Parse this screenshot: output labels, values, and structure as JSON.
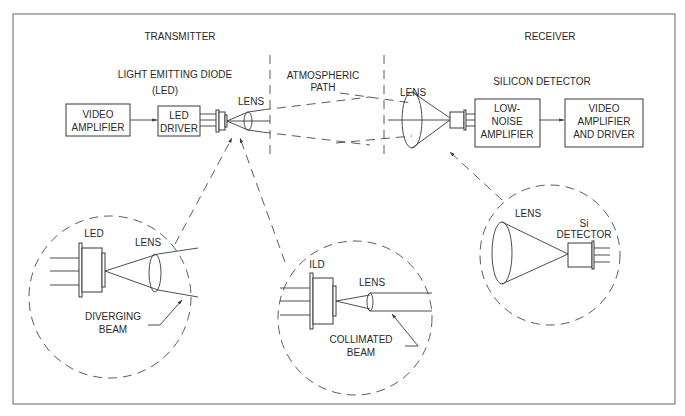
{
  "diagram": {
    "type": "free-space optical communication link block diagram",
    "sections": {
      "transmitter": "TRANSMITTER",
      "receiver": "RECEIVER"
    },
    "top_labels": {
      "led_line1": "LIGHT EMITTING DIODE",
      "led_line2": "(LED)",
      "atmos_line1": "ATMOSPHERIC",
      "atmos_line2": "PATH",
      "silicon_detector": "SILICON DETECTOR",
      "tx_lens": "LENS",
      "rx_lens": "LENS"
    },
    "blocks": [
      {
        "id": "video-amplifier",
        "lines": [
          "VIDEO",
          "AMPLIFIER"
        ]
      },
      {
        "id": "led-driver",
        "lines": [
          "LED",
          "DRIVER"
        ]
      },
      {
        "id": "low-noise-amplifier",
        "lines": [
          "LOW-",
          "NOISE",
          "AMPLIFIER"
        ]
      },
      {
        "id": "video-amplifier-and-driver",
        "lines": [
          "VIDEO",
          "AMPLIFIER",
          "AND DRIVER"
        ]
      }
    ],
    "insets": {
      "led": {
        "source_label": "LED",
        "lens_label": "LENS",
        "beam_line1": "DIVERGING",
        "beam_line2": "BEAM"
      },
      "ild": {
        "source_label": "ILD",
        "lens_label": "LENS",
        "beam_line1": "COLLIMATED",
        "beam_line2": "BEAM"
      },
      "detector": {
        "lens_label": "LENS",
        "det_line1": "Si",
        "det_line2": "DETECTOR"
      }
    },
    "edges": [
      {
        "from": "video-amplifier",
        "to": "led-driver",
        "style": "solid arrow"
      },
      {
        "from": "led-driver",
        "to": "led",
        "style": "leads"
      },
      {
        "from": "led",
        "to": "tx-lens",
        "style": "beam"
      },
      {
        "from": "tx-lens",
        "to": "rx-lens",
        "style": "dashed beam via atmospheric path"
      },
      {
        "from": "rx-lens",
        "to": "si-detector",
        "style": "beam"
      },
      {
        "from": "si-detector",
        "to": "low-noise-amplifier",
        "style": "leads"
      },
      {
        "from": "low-noise-amplifier",
        "to": "video-amplifier-and-driver",
        "style": "solid arrow"
      }
    ],
    "colors": {
      "line": "#3a3a3a",
      "frame": "#8a8a8a",
      "text": "#2a2a2a",
      "background": "#ffffff"
    }
  }
}
